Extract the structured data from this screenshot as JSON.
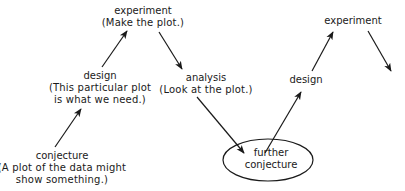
{
  "diagram": {
    "type": "iterative-cycle-flow",
    "nodes": [
      {
        "id": "experiment1",
        "title": "experiment",
        "note": "(Make the plot.)"
      },
      {
        "id": "design1",
        "title": "design",
        "note_line1": "(This particular plot",
        "note_line2": "is what we need.)"
      },
      {
        "id": "conjecture1",
        "title": "conjecture",
        "note_line1": "(A plot of the data might",
        "note_line2": "show something.)"
      },
      {
        "id": "analysis1",
        "title": "analysis",
        "note": "(Look at the plot.)"
      },
      {
        "id": "further_conjecture",
        "title_line1": "further",
        "title_line2": "conjecture",
        "shape": "ellipse"
      },
      {
        "id": "design2",
        "title": "design"
      },
      {
        "id": "experiment2",
        "title": "experiment"
      }
    ],
    "edges": [
      {
        "from": "conjecture1",
        "to": "design1"
      },
      {
        "from": "design1",
        "to": "experiment1"
      },
      {
        "from": "experiment1",
        "to": "analysis1"
      },
      {
        "from": "analysis1",
        "to": "further_conjecture"
      },
      {
        "from": "further_conjecture",
        "to": "design2"
      },
      {
        "from": "design2",
        "to": "experiment2"
      },
      {
        "from": "experiment2",
        "to": "continuation"
      }
    ],
    "colors": {
      "line": "#1a1a1a",
      "text": "#1a1a1a",
      "background": "#ffffff"
    }
  }
}
